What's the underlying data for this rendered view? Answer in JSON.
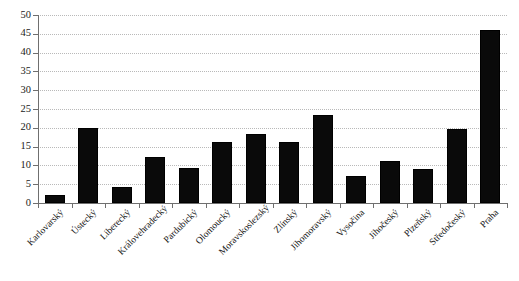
{
  "chart_data": {
    "type": "bar",
    "title": "",
    "subtitle": "",
    "xlabel": "",
    "ylabel": "",
    "ylim": [
      0,
      50
    ],
    "ytick_step": 5,
    "yticks": [
      0,
      5,
      10,
      15,
      20,
      25,
      30,
      35,
      40,
      45,
      50
    ],
    "ytick_labels": [
      "0",
      "5",
      "10",
      "15",
      "20",
      "25",
      "30",
      "35",
      "40",
      "45",
      "50"
    ],
    "grid": true,
    "grid_style": "dotted",
    "grid_axis": "y",
    "legend": false,
    "legend_position": "none",
    "bar_color": "#0a0a0a",
    "background_color": "#ffffff",
    "axis_color": "#6f6f6f",
    "grid_color": "#b9b9b9",
    "xtick_label_rotation": -45,
    "categories": [
      "Karlovarský",
      "Ústecký",
      "Liberecký",
      "Královehradecký",
      "Pardubický",
      "Olomoucký",
      "Moravskoslezský",
      "Zlínský",
      "Jihomoravský",
      "Vysočina",
      "Jihočeský",
      "Plzeňský",
      "Středočeský",
      "Praha"
    ],
    "values": [
      2,
      20,
      4.2,
      12.2,
      9.2,
      16.3,
      18.3,
      16.3,
      23.5,
      7.3,
      11.3,
      9,
      19.6,
      46
    ]
  }
}
